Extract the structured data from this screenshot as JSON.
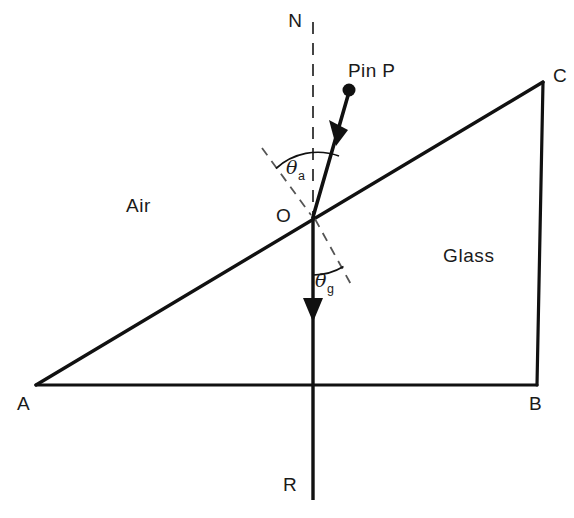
{
  "figure": {
    "background_color": "#ffffff",
    "stroke_color": "#111111",
    "dash_color": "#555555",
    "width": 574,
    "height": 518
  },
  "labels": {
    "normal_top": "N",
    "pin": "Pin  P",
    "vertex_c": "C",
    "vertex_a": "A",
    "vertex_b": "B",
    "origin": "O",
    "medium_left": "Air",
    "medium_right": "Glass",
    "ray_bottom": "R",
    "theta_air_symbol": "θ",
    "theta_air_subscript": "a",
    "theta_glass_symbol": "θ",
    "theta_glass_subscript": "g"
  },
  "geometry": {
    "point_A": [
      36,
      385
    ],
    "point_B": [
      537,
      385
    ],
    "point_C": [
      543,
      82
    ],
    "point_O": [
      313,
      217
    ],
    "pin_dot": [
      349,
      90
    ],
    "pin_dot_radius": 6,
    "incident_arrow_tip": [
      340,
      134
    ],
    "refracted_arrow_tip": [
      313,
      320
    ],
    "normal_line_top": [
      313,
      22
    ],
    "ray_line_bottom": [
      313,
      500
    ],
    "normal_extension_dash_start": [
      263,
      150
    ],
    "glass_normal_dash_end": [
      352,
      287
    ],
    "theta_air_arc_radius": 62,
    "theta_glass_arc_radius": 58
  },
  "annotations": {
    "incident_ray_label": "incident ray from pin P to O",
    "refracted_ray_label": "refracted ray O to R",
    "normal_label": "normal N-O-R dashed above surface"
  }
}
